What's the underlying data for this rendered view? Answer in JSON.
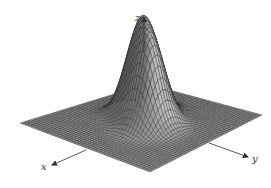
{
  "figure": {
    "type": "3d-surface",
    "axes": {
      "x": {
        "label": "x"
      },
      "y": {
        "label": "y"
      },
      "z": {
        "label": "z"
      }
    },
    "surface": {
      "peaks": 2,
      "grid_resolution": 48,
      "fill_color": "#9a9a9a",
      "line_color": "#2a2a2a"
    },
    "colors": {
      "background": "#ffffff",
      "axis": "#333333"
    }
  }
}
